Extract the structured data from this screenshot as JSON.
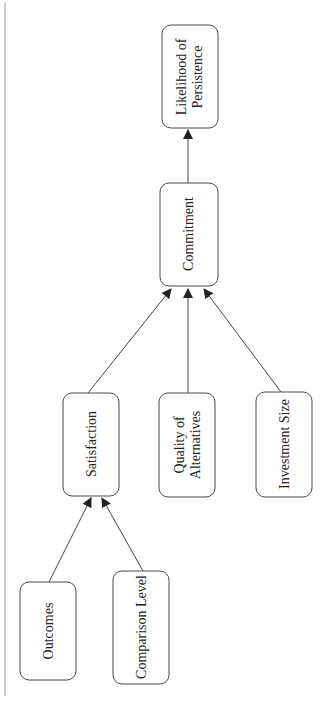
{
  "diagram": {
    "type": "path-model",
    "orientation": "rotated-90-ccw",
    "colors": {
      "stroke": "#4a4a4a",
      "text": "#222222",
      "background": "#ffffff",
      "margin_line": "#9a9a9a"
    },
    "nodes": {
      "outcomes": {
        "lines": [
          "Outcomes"
        ]
      },
      "comparison_level": {
        "lines": [
          "Comparison Level"
        ]
      },
      "satisfaction": {
        "lines": [
          "Satisfaction"
        ]
      },
      "quality_of_alternatives": {
        "lines": [
          "Quality of",
          "Alternatives"
        ]
      },
      "investment_size": {
        "lines": [
          "Investment Size"
        ]
      },
      "commitment": {
        "lines": [
          "Commitment"
        ]
      },
      "likelihood_of_persistence": {
        "lines": [
          "Likelihood of",
          "Persistence"
        ]
      }
    },
    "edges": [
      {
        "from": "Outcomes",
        "to": "Satisfaction"
      },
      {
        "from": "Comparison Level",
        "to": "Satisfaction"
      },
      {
        "from": "Satisfaction",
        "to": "Commitment"
      },
      {
        "from": "Quality of Alternatives",
        "to": "Commitment"
      },
      {
        "from": "Investment Size",
        "to": "Commitment"
      },
      {
        "from": "Commitment",
        "to": "Likelihood of Persistence"
      }
    ]
  }
}
